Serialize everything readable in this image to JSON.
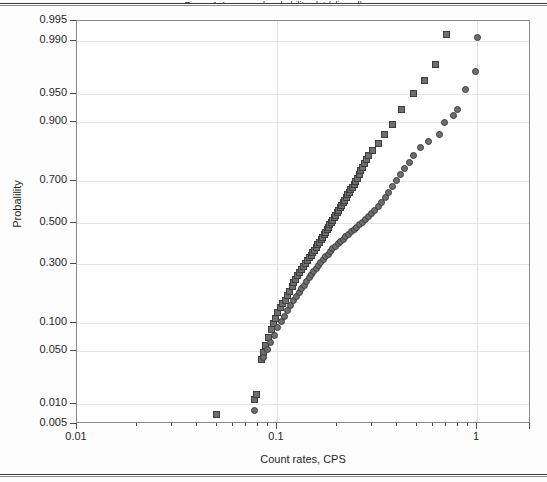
{
  "figure": {
    "caption_clipped": "Figure 1. Lognormal probability plot (clipped)",
    "x_axis_title": "Count rates, CPS",
    "y_axis_title": "Probalility"
  },
  "axes": {
    "x_major_labels": [
      "0.01",
      "0.1",
      "1"
    ],
    "x_major_values": [
      0.01,
      0.1,
      1
    ],
    "x_scale": "log",
    "x_range": [
      0.01,
      2
    ],
    "y_scale": "probability",
    "y_tick_labels": [
      "0.995",
      "0.990",
      "0.950",
      "0.900",
      "0.700",
      "0.500",
      "0.300",
      "0.100",
      "0.050",
      "0.010",
      "0.005"
    ],
    "y_tick_values": [
      0.995,
      0.99,
      0.95,
      0.9,
      0.7,
      0.5,
      0.3,
      0.1,
      0.05,
      0.01,
      0.005
    ],
    "grid": true
  },
  "colors": {
    "marker_fill": "#6e6e6e",
    "marker_edge": "#3d3d3d",
    "grid": "#e4e4e4",
    "frame": "#8a8a8a",
    "text": "#1f1f1f"
  },
  "chart_data": {
    "type": "scatter",
    "title": "",
    "subtitle": "",
    "xlabel": "Count rates, CPS",
    "ylabel": "Probalility",
    "xscale": "log",
    "yscale": "normal-probability",
    "xlim": [
      0.01,
      2
    ],
    "ylim": [
      0.005,
      0.995
    ],
    "grid": true,
    "legend": "none",
    "series": [
      {
        "name": "Series 1 (squares)",
        "marker": "square",
        "color": "#6e6e6e",
        "points": [
          [
            0.05,
            0.007
          ],
          [
            0.077,
            0.012
          ],
          [
            0.079,
            0.014
          ],
          [
            0.084,
            0.04
          ],
          [
            0.086,
            0.048
          ],
          [
            0.088,
            0.058
          ],
          [
            0.091,
            0.07
          ],
          [
            0.094,
            0.085
          ],
          [
            0.096,
            0.098
          ],
          [
            0.098,
            0.11
          ],
          [
            0.101,
            0.125
          ],
          [
            0.104,
            0.14
          ],
          [
            0.107,
            0.15
          ],
          [
            0.11,
            0.16
          ],
          [
            0.113,
            0.175
          ],
          [
            0.116,
            0.19
          ],
          [
            0.119,
            0.205
          ],
          [
            0.121,
            0.22
          ],
          [
            0.124,
            0.235
          ],
          [
            0.127,
            0.25
          ],
          [
            0.13,
            0.262
          ],
          [
            0.133,
            0.275
          ],
          [
            0.136,
            0.288
          ],
          [
            0.139,
            0.3
          ],
          [
            0.142,
            0.312
          ],
          [
            0.145,
            0.325
          ],
          [
            0.148,
            0.338
          ],
          [
            0.151,
            0.35
          ],
          [
            0.154,
            0.362
          ],
          [
            0.157,
            0.375
          ],
          [
            0.16,
            0.388
          ],
          [
            0.163,
            0.4
          ],
          [
            0.166,
            0.412
          ],
          [
            0.169,
            0.425
          ],
          [
            0.172,
            0.438
          ],
          [
            0.175,
            0.45
          ],
          [
            0.178,
            0.462
          ],
          [
            0.181,
            0.475
          ],
          [
            0.184,
            0.488
          ],
          [
            0.187,
            0.5
          ],
          [
            0.19,
            0.512
          ],
          [
            0.194,
            0.525
          ],
          [
            0.197,
            0.538
          ],
          [
            0.2,
            0.55
          ],
          [
            0.203,
            0.562
          ],
          [
            0.207,
            0.575
          ],
          [
            0.21,
            0.588
          ],
          [
            0.214,
            0.6
          ],
          [
            0.218,
            0.612
          ],
          [
            0.222,
            0.625
          ],
          [
            0.226,
            0.638
          ],
          [
            0.23,
            0.65
          ],
          [
            0.234,
            0.662
          ],
          [
            0.238,
            0.675
          ],
          [
            0.243,
            0.688
          ],
          [
            0.248,
            0.7
          ],
          [
            0.253,
            0.715
          ],
          [
            0.258,
            0.73
          ],
          [
            0.263,
            0.745
          ],
          [
            0.268,
            0.76
          ],
          [
            0.274,
            0.775
          ],
          [
            0.28,
            0.79
          ],
          [
            0.287,
            0.805
          ],
          [
            0.3,
            0.82
          ],
          [
            0.32,
            0.845
          ],
          [
            0.345,
            0.87
          ],
          [
            0.38,
            0.895
          ],
          [
            0.42,
            0.925
          ],
          [
            0.48,
            0.95
          ],
          [
            0.545,
            0.965
          ],
          [
            0.62,
            0.978
          ],
          [
            0.7,
            0.992
          ]
        ]
      },
      {
        "name": "Series 2 (circles)",
        "marker": "circle",
        "color": "#6e6e6e",
        "points": [
          [
            0.077,
            0.008
          ],
          [
            0.086,
            0.042
          ],
          [
            0.09,
            0.052
          ],
          [
            0.093,
            0.062
          ],
          [
            0.097,
            0.075
          ],
          [
            0.101,
            0.09
          ],
          [
            0.105,
            0.102
          ],
          [
            0.109,
            0.115
          ],
          [
            0.113,
            0.13
          ],
          [
            0.117,
            0.145
          ],
          [
            0.121,
            0.158
          ],
          [
            0.125,
            0.172
          ],
          [
            0.129,
            0.186
          ],
          [
            0.133,
            0.2
          ],
          [
            0.137,
            0.212
          ],
          [
            0.141,
            0.226
          ],
          [
            0.145,
            0.24
          ],
          [
            0.149,
            0.252
          ],
          [
            0.153,
            0.265
          ],
          [
            0.157,
            0.278
          ],
          [
            0.161,
            0.292
          ],
          [
            0.165,
            0.305
          ],
          [
            0.17,
            0.318
          ],
          [
            0.175,
            0.33
          ],
          [
            0.18,
            0.343
          ],
          [
            0.185,
            0.356
          ],
          [
            0.19,
            0.368
          ],
          [
            0.196,
            0.38
          ],
          [
            0.202,
            0.392
          ],
          [
            0.208,
            0.404
          ],
          [
            0.214,
            0.416
          ],
          [
            0.221,
            0.428
          ],
          [
            0.228,
            0.44
          ],
          [
            0.235,
            0.452
          ],
          [
            0.243,
            0.464
          ],
          [
            0.251,
            0.476
          ],
          [
            0.259,
            0.488
          ],
          [
            0.268,
            0.5
          ],
          [
            0.277,
            0.515
          ],
          [
            0.287,
            0.53
          ],
          [
            0.297,
            0.545
          ],
          [
            0.308,
            0.562
          ],
          [
            0.32,
            0.58
          ],
          [
            0.333,
            0.6
          ],
          [
            0.347,
            0.625
          ],
          [
            0.362,
            0.65
          ],
          [
            0.378,
            0.678
          ],
          [
            0.395,
            0.705
          ],
          [
            0.414,
            0.73
          ],
          [
            0.435,
            0.755
          ],
          [
            0.458,
            0.78
          ],
          [
            0.484,
            0.805
          ],
          [
            0.52,
            0.83
          ],
          [
            0.57,
            0.85
          ],
          [
            0.65,
            0.87
          ],
          [
            0.69,
            0.9
          ],
          [
            0.76,
            0.915
          ],
          [
            0.8,
            0.925
          ],
          [
            0.88,
            0.955
          ],
          [
            0.985,
            0.973
          ],
          [
            1.0,
            0.991
          ]
        ]
      }
    ]
  }
}
